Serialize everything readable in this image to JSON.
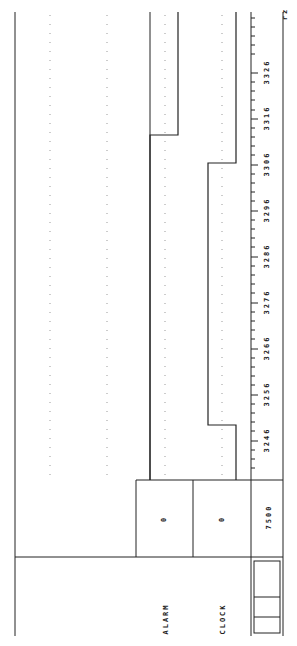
{
  "orientation": "rotated-90",
  "channels": [
    {
      "name": "ALARM",
      "value": "0"
    },
    {
      "name": "CLOCK",
      "value": "0"
    }
  ],
  "axis": {
    "start_label": "7500",
    "tick_labels": [
      "3246",
      "3256",
      "3266",
      "3276",
      "3286",
      "3296",
      "3306",
      "3316",
      "3326"
    ],
    "corner_mark": "rz"
  },
  "colors": {
    "line": "#222222",
    "grid": "#999999",
    "background": "#ffffff"
  }
}
